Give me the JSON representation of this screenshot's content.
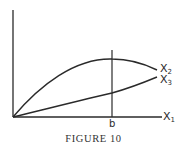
{
  "figure": {
    "caption": "FIGURE 10",
    "stroke_color": "#2a2a2a",
    "axes": {
      "x_axis_label_main": "X",
      "x_axis_label_sub": "1",
      "tick_label": "b"
    },
    "curves": [
      {
        "name": "X2",
        "label_main": "X",
        "label_sub": "2",
        "shape": "concave, rises then peaks at b, then falls"
      },
      {
        "name": "X3",
        "label_main": "X",
        "label_sub": "3",
        "shape": "convex, steadily increasing"
      }
    ]
  }
}
